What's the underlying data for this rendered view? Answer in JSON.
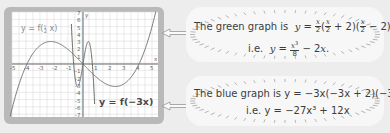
{
  "graph": {
    "x_ticks": [
      "-5",
      "-4",
      "-3",
      "-2",
      "-1",
      "1",
      "2",
      "3",
      "4",
      "5"
    ],
    "y_ticks_pos": [
      "1",
      "2",
      "3",
      "4",
      "5",
      "6",
      "7"
    ],
    "y_ticks_neg": [
      "-1",
      "-2",
      "-3",
      "-4",
      "-5",
      "-6",
      "-7"
    ],
    "x_axis_label": "x",
    "y_axis_label": "y",
    "label_green": "y = f(½ x)",
    "label_green_prefix": "y = f",
    "label_green_arg": "x",
    "label_blue": "y = f(−3x)",
    "colors": {
      "panel_border": "#b9b9b9",
      "grid_bg": "#ffffff",
      "grid_line": "#dcdcdc",
      "axis": "#555555",
      "curve": "#7a7a7a"
    }
  },
  "callouts": [
    {
      "line1_prefix": "The green graph is",
      "line1_eq": "y = x/2 (x/2 + 2)(x/2 − 2)",
      "line2_prefix": "i.e.",
      "line2_eq": "y = x³/8 − 2x."
    },
    {
      "line1_prefix": "The blue graph is",
      "line1_eq": "y = −3x(−3x + 2)(−3x − 2)",
      "line2_prefix": "i.e.",
      "line2_eq": "y = −27x³ + 12x"
    }
  ],
  "chart_data": {
    "type": "line",
    "title": "",
    "xlabel": "x",
    "ylabel": "y",
    "xlim": [
      -5,
      5
    ],
    "ylim": [
      -7,
      7
    ],
    "grid": true,
    "series": [
      {
        "name": "y = f(½ x) = x³/8 − 2x",
        "x": [
          -5,
          -4,
          -3,
          -2.31,
          -2,
          -1,
          0,
          1,
          2,
          2.31,
          3,
          4,
          5
        ],
        "y": [
          -5.63,
          0,
          2.63,
          3.08,
          3,
          1.88,
          0,
          -1.88,
          -3,
          -3.08,
          -2.63,
          0,
          5.63
        ]
      },
      {
        "name": "y = f(−3x) = −27x³ + 12x",
        "x": [
          -0.8,
          -0.667,
          -0.385,
          0,
          0.385,
          0.667,
          0.8
        ],
        "y": [
          4.22,
          0,
          -3.08,
          0,
          3.08,
          0,
          -4.22
        ]
      }
    ]
  }
}
